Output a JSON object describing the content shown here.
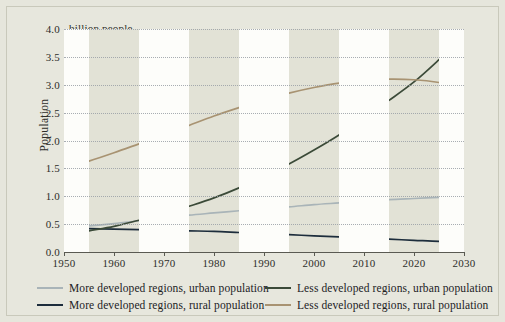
{
  "figure": {
    "background_color": "#e6e6dc",
    "plot_background_color": "#e2e2d6",
    "band_color": "#fdfdfa"
  },
  "axes": {
    "y_title": "Population",
    "unit_note": "billion people",
    "y_ticks": [
      "0.0",
      "0.5",
      "1.0",
      "1.5",
      "2.0",
      "2.5",
      "3.0",
      "3.5",
      "4.0"
    ],
    "x_ticks": [
      "1950",
      "1960",
      "1970",
      "1980",
      "1990",
      "2000",
      "2010",
      "2020",
      "2030"
    ]
  },
  "legend": {
    "items": [
      {
        "label": "More developed regions, urban population",
        "color": "#a9b4b8"
      },
      {
        "label": "Less developed regions, urban population",
        "color": "#3b4a38"
      },
      {
        "label": "More developed regions, rural population",
        "color": "#1d2d3c"
      },
      {
        "label": "Less developed regions, rural population",
        "color": "#a89372"
      }
    ]
  },
  "chart_data": {
    "type": "line",
    "title": "",
    "subtitle": "",
    "xlabel": "",
    "ylabel": "Population",
    "unit_note": "billion people",
    "xlim": [
      1950,
      2030
    ],
    "ylim": [
      0.0,
      4.0
    ],
    "ytick_step": 0.5,
    "xtick_step": 10,
    "grid": "horizontal-dotted",
    "legend_position": "below-plot",
    "x": [
      1950,
      1955,
      1960,
      1965,
      1970,
      1975,
      1980,
      1985,
      1990,
      1995,
      2000,
      2005,
      2010,
      2015,
      2020,
      2025,
      2030
    ],
    "series": [
      {
        "name": "More developed regions, urban population",
        "color": "#a9b4b8",
        "values": [
          0.44,
          0.47,
          0.51,
          0.56,
          0.61,
          0.66,
          0.7,
          0.74,
          0.78,
          0.81,
          0.85,
          0.88,
          0.91,
          0.94,
          0.96,
          0.98,
          1.0
        ]
      },
      {
        "name": "More developed regions, rural population",
        "color": "#1d2d3c",
        "values": [
          0.43,
          0.42,
          0.41,
          0.4,
          0.39,
          0.38,
          0.37,
          0.35,
          0.33,
          0.31,
          0.29,
          0.27,
          0.25,
          0.23,
          0.21,
          0.19,
          0.18
        ]
      },
      {
        "name": "Less developed regions, urban population",
        "color": "#3b4a38",
        "values": [
          0.3,
          0.38,
          0.46,
          0.57,
          0.68,
          0.82,
          0.97,
          1.15,
          1.36,
          1.58,
          1.83,
          2.1,
          2.41,
          2.72,
          3.05,
          3.45,
          3.88
        ]
      },
      {
        "name": "Less developed regions, rural population",
        "color": "#a89372",
        "values": [
          1.5,
          1.63,
          1.78,
          1.94,
          2.1,
          2.27,
          2.44,
          2.59,
          2.73,
          2.85,
          2.95,
          3.03,
          3.08,
          3.1,
          3.09,
          3.04,
          2.95
        ]
      }
    ]
  }
}
